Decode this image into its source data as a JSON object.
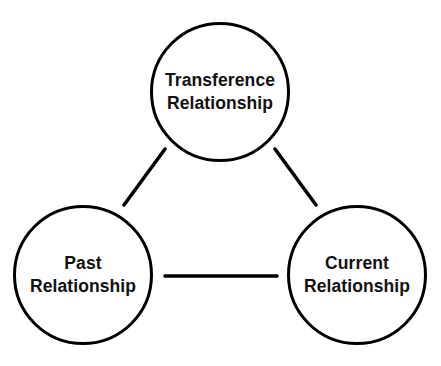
{
  "diagram": {
    "type": "triangle-relationship-diagram",
    "colors": {
      "stroke": "#000000",
      "text": "#111111",
      "background": "#ffffff"
    },
    "nodes": [
      {
        "id": "transference",
        "line1": "Transference",
        "line2": "Relationship",
        "position": "top"
      },
      {
        "id": "past",
        "line1": "Past",
        "line2": "Relationship",
        "position": "bottom-left"
      },
      {
        "id": "current",
        "line1": "Current",
        "line2": "Relationship",
        "position": "bottom-right"
      }
    ],
    "edges": [
      {
        "from": "transference",
        "to": "past"
      },
      {
        "from": "transference",
        "to": "current"
      },
      {
        "from": "past",
        "to": "current"
      }
    ]
  }
}
